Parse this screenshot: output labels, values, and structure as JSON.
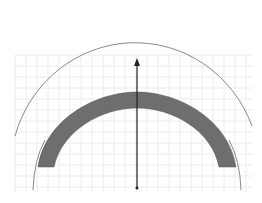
{
  "diagram": {
    "type": "arch-cross-section",
    "grid": {
      "x0": 15,
      "y0": 55,
      "x1": 252,
      "y1": 192,
      "spacing": 11,
      "color": "#ececec"
    },
    "outer_arc": {
      "cx": 137,
      "cy": 188,
      "r": 129,
      "color": "#8a8a8a"
    },
    "band": {
      "cx": 137,
      "cy": 172,
      "r_outer": 80,
      "r_inner": 64,
      "fill": "#6e6e6e",
      "stroke": "#555555"
    },
    "axis": {
      "x": 137,
      "y_top": 58,
      "y_bottom": 188,
      "color": "#222222"
    }
  }
}
